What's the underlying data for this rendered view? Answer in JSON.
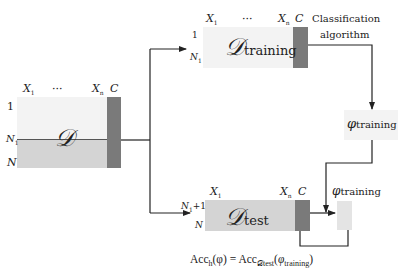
{
  "diagram": {
    "full_dataset": {
      "symbol": "𝒟",
      "col_first": "X",
      "col_first_sub": "1",
      "col_ellipsis": "···",
      "col_last": "X",
      "col_last_sub": "n",
      "class_col": "C",
      "row_first": "1",
      "row_split": "N",
      "row_split_sub": "1",
      "row_last": "N"
    },
    "training_dataset": {
      "symbol": "𝒟",
      "subscript": "training",
      "col_first": "X",
      "col_first_sub": "1",
      "col_ellipsis": "···",
      "col_last": "X",
      "col_last_sub": "n",
      "class_col": "C",
      "row_first": "1",
      "row_last": "N",
      "row_last_sub": "1"
    },
    "algorithm_label_line1": "Classification",
    "algorithm_label_line2": "algorithm",
    "model": {
      "symbol": "φ",
      "subscript": "training"
    },
    "test_dataset": {
      "symbol": "𝒟",
      "subscript": "test",
      "col_first": "X",
      "col_first_sub": "1",
      "col_last": "X",
      "col_last_sub": "n",
      "class_col": "C",
      "row_first": "N",
      "row_first_sub": "1",
      "row_first_suffix": "+1",
      "row_last": "N"
    },
    "prediction": {
      "symbol": "φ",
      "subscript": "training"
    },
    "formula": {
      "lhs": "Acc",
      "lhs_sub": "h",
      "lhs_arg": "(φ)",
      "equals": " = ",
      "rhs": "Acc",
      "rhs_sub": "𝒟test",
      "rhs_arg_open": "(",
      "rhs_arg_symbol": "φ",
      "rhs_arg_sub": "training",
      "rhs_arg_close": ")"
    },
    "colors": {
      "data_light": "#ededed",
      "data_split": "#d4d4d4",
      "class_column": "#7a7a7a",
      "line": "#222222"
    }
  }
}
